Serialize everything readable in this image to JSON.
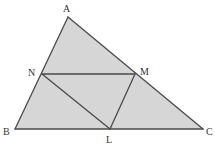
{
  "diagram": {
    "type": "geometry-triangle-midpoints",
    "fill_color": "#d6d6d6",
    "line_color": "#4a4a4a",
    "points": {
      "A": {
        "label": "A",
        "x": 68,
        "y": 17,
        "lx": 63,
        "ly": 12
      },
      "B": {
        "label": "B",
        "x": 15,
        "y": 129,
        "lx": 3,
        "ly": 135
      },
      "C": {
        "label": "C",
        "x": 203,
        "y": 129,
        "lx": 206,
        "ly": 135
      },
      "N": {
        "label": "N",
        "x": 42,
        "y": 74,
        "lx": 28,
        "ly": 76
      },
      "M": {
        "label": "M",
        "x": 135,
        "y": 74,
        "lx": 140,
        "ly": 75
      },
      "L": {
        "label": "L",
        "x": 110,
        "y": 129,
        "lx": 106,
        "ly": 143
      }
    },
    "segments": [
      [
        "A",
        "B"
      ],
      [
        "B",
        "C"
      ],
      [
        "C",
        "A"
      ],
      [
        "N",
        "M"
      ],
      [
        "N",
        "L"
      ],
      [
        "M",
        "L"
      ]
    ]
  }
}
